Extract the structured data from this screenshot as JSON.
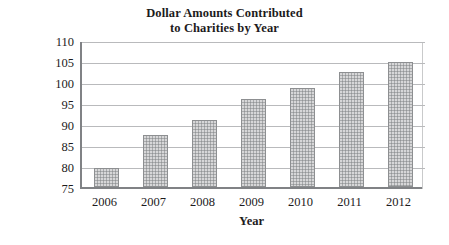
{
  "chart_data": {
    "type": "bar",
    "title": "Dollar Amounts Contributed to Charities by Year",
    "title_lines": [
      "Dollar Amounts Contributed",
      "to Charities by Year"
    ],
    "xlabel": "Year",
    "ylabel": "Billions of Dollars",
    "categories": [
      "2006",
      "2007",
      "2008",
      "2009",
      "2010",
      "2011",
      "2012"
    ],
    "values": [
      79.6,
      87.3,
      91.0,
      96.0,
      98.5,
      102.3,
      104.8
    ],
    "ylim": [
      75,
      110
    ],
    "ytick_values": [
      110,
      105,
      100,
      95,
      90,
      85,
      80,
      75
    ],
    "ytick_labels": [
      "110",
      "105",
      "100",
      "95",
      "90",
      "85",
      "80",
      "75"
    ],
    "ytick_step": 5,
    "grid": true,
    "grid_axis": "y",
    "legend": false,
    "bar_fill_color": "#a9abad",
    "bar_edge_color": "#8d8f91",
    "axis_color": "#808285",
    "grid_color": "#b9babc",
    "text_color": "#1d1b1c",
    "background_color": "#ffffff",
    "series": [
      {
        "name": "Dollar Amounts Contributed to Charities",
        "values": [
          79.6,
          87.3,
          91.0,
          96.0,
          98.5,
          102.3,
          104.8
        ]
      }
    ],
    "points": [
      {
        "category": "2006",
        "value": 79.6
      },
      {
        "category": "2007",
        "value": 87.3
      },
      {
        "category": "2008",
        "value": 91.0
      },
      {
        "category": "2009",
        "value": 96.0
      },
      {
        "category": "2010",
        "value": 98.5
      },
      {
        "category": "2011",
        "value": 102.3
      },
      {
        "category": "2012",
        "value": 104.8
      }
    ]
  }
}
